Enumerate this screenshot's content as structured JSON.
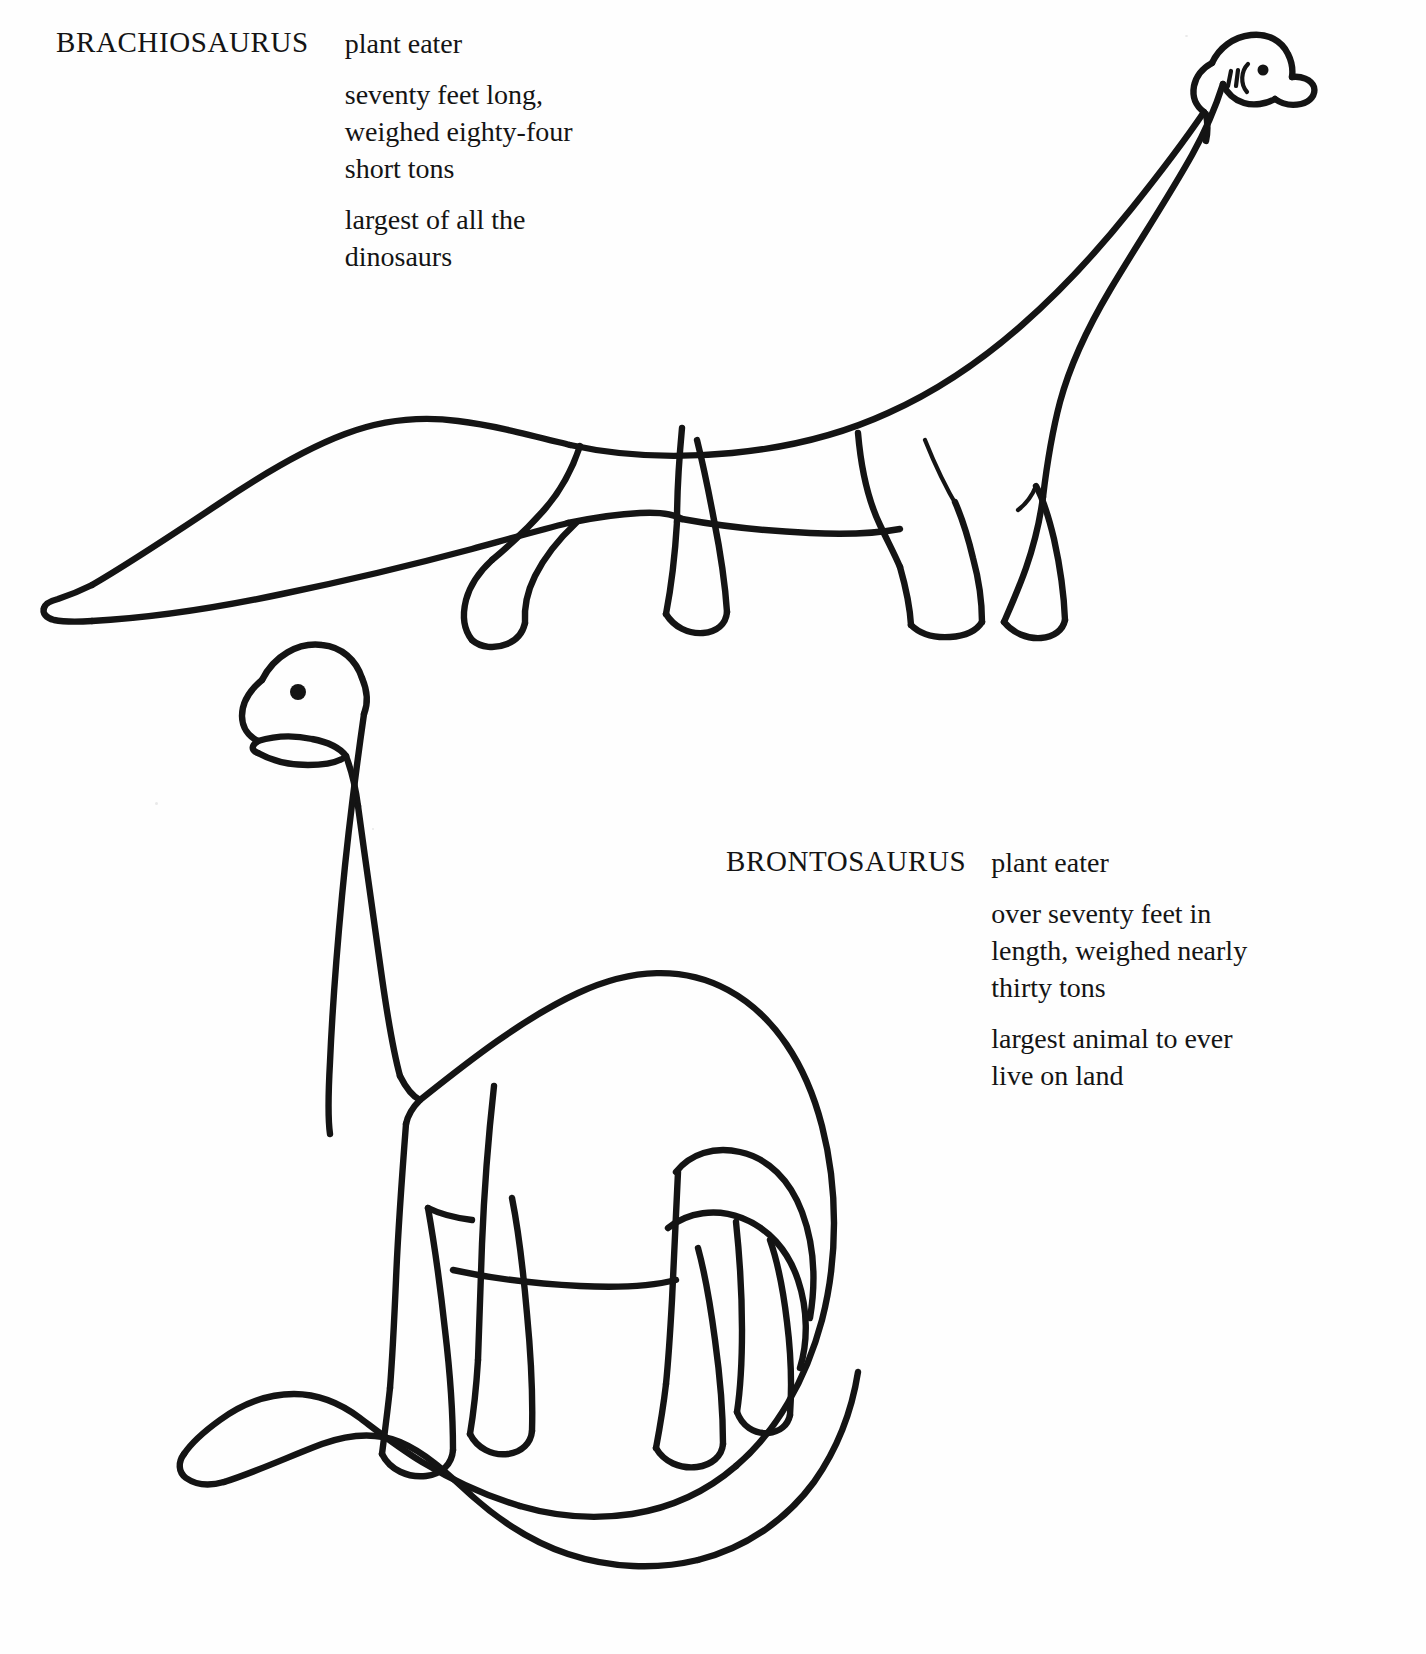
{
  "page": {
    "title": "Dinosaurs",
    "background_color": "#ffffff",
    "ink_color": "#141414",
    "style": "black and white line-art coloring page"
  },
  "entries": [
    {
      "name": "BRACHIOSAURUS",
      "diet": "plant eater",
      "facts": [
        "plant eater",
        "seventy feet long,\nweighed eighty-four\nshort tons",
        "largest of all the\ndinosaurs"
      ],
      "figure": {
        "name": "brachiosaurus-drawing",
        "description": "outline drawing of a Brachiosaurus standing in profile facing right, long neck raised high, long tapering tail to the left",
        "features": [
          "head-crest",
          "nostril-marks",
          "eye-dot",
          "snout",
          "four-legs",
          "long-tail"
        ]
      }
    },
    {
      "name": "BRONTOSAURUS",
      "diet": "plant eater",
      "facts": [
        "plant eater",
        "over seventy feet in\nlength, weighed nearly\nthirty tons",
        "largest animal to ever\nlive on land"
      ],
      "figure": {
        "name": "brontosaurus-drawing",
        "description": "outline drawing of a Brontosaurus facing left, tall upright neck, rounded humped back, long curving tail sweeping to the lower left",
        "features": [
          "eye-dot",
          "open-mouth",
          "four-legs",
          "humped-back",
          "long-curving-tail"
        ]
      }
    }
  ]
}
